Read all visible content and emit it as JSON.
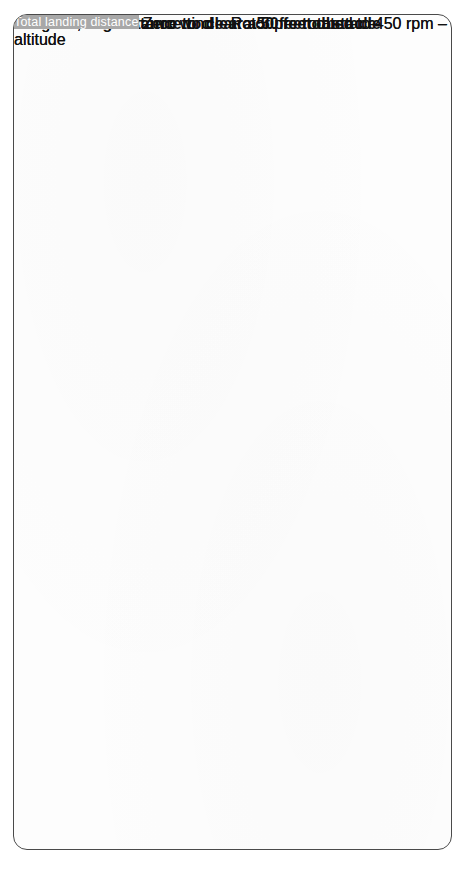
{
  "page": {
    "orientation": "rotated-90-ccw",
    "background": "#ffffff",
    "sheet_border_color": "#4a4a4a",
    "bar_color": "#a8a8a8",
    "label_chip_color": "#9c9c9c",
    "curve_color": "#1a1a1a"
  },
  "takeoff": {
    "title": "Total takeoff distance to clear a 50 feet obstacle",
    "subtitle": "Weight 1,500 lb – Zero wind – Rotor pre-rotated to 450 rpm – Smooth hard surface runway",
    "x_axis_label": "Total takeoff distance",
    "y_axis_label_line1": "Pressure",
    "y_axis_label_line2": "altitude",
    "x_ticks": [
      "800",
      "1,000",
      "1,200",
      "1,400",
      "1,600",
      "1,800",
      "2,000",
      "2,200",
      "2,400",
      "2,600",
      "2,800",
      "3,000"
    ],
    "y_ticks": [
      "0",
      "1,000",
      "2,000",
      "3,000",
      "4,000"
    ],
    "curve_labels": [
      "0 °F OAT",
      "20 °",
      "40 °",
      "60 °",
      "80 °",
      "100 °"
    ]
  },
  "landing": {
    "title": "Total landing distance to clear a 50 feet obstacle",
    "subtitle": "Weight 1,500 lb – Zero wind – Rotor pre-rotated to 450 rpm – Smooth hard surface runway",
    "x_axis_label": "Total landing distance",
    "y_axis_label_line1": "Pressure",
    "y_axis_label_line2": "altitude",
    "x_ticks": [
      "500",
      "510",
      "520",
      "530",
      "540"
    ],
    "y_ticks": [
      "0",
      "1,000",
      "2,000",
      "3,000",
      "4,000"
    ],
    "curve_labels": [
      "0 °F OAT",
      "20 °",
      "40 °",
      "60 °",
      "80 °",
      "100 °"
    ]
  },
  "chart_data": [
    {
      "type": "line",
      "id": "takeoff-distance",
      "title": "Total takeoff distance to clear a 50 feet obstacle",
      "subtitle": "Weight 1,500 lb – Zero wind – Rotor pre-rotated to 450 rpm – Smooth hard surface runway",
      "xlabel": "Total takeoff distance",
      "ylabel": "Pressure altitude",
      "xlim": [
        800,
        3000
      ],
      "ylim": [
        0,
        4000
      ],
      "xticks": [
        800,
        1000,
        1200,
        1400,
        1600,
        1800,
        2000,
        2200,
        2400,
        2600,
        2800,
        3000
      ],
      "yticks": [
        0,
        1000,
        2000,
        3000,
        4000
      ],
      "grid": true,
      "legend": "inline-curve-labels",
      "series": [
        {
          "name": "0 °F OAT",
          "x": [
            980,
            1540
          ],
          "y": [
            0,
            4000
          ]
        },
        {
          "name": "20 °",
          "x": [
            1130,
            1800
          ],
          "y": [
            0,
            4000
          ]
        },
        {
          "name": "40 °",
          "x": [
            1310,
            2090
          ],
          "y": [
            0,
            4000
          ]
        },
        {
          "name": "60 °",
          "x": [
            1500,
            2400
          ],
          "y": [
            0,
            4000
          ]
        },
        {
          "name": "80 °",
          "x": [
            1700,
            2700
          ],
          "y": [
            0,
            4000
          ]
        },
        {
          "name": "100 °",
          "x": [
            1930,
            3000
          ],
          "y": [
            0,
            4000
          ]
        }
      ]
    },
    {
      "type": "line",
      "id": "landing-distance",
      "title": "Total landing distance to clear a 50 feet obstacle",
      "subtitle": "Weight 1,500 lb – Zero wind – Rotor pre-rotated to 450 rpm – Smooth hard surface runway",
      "xlabel": "Total landing distance",
      "ylabel": "Pressure altitude",
      "xlim": [
        500,
        540
      ],
      "ylim": [
        0,
        4000
      ],
      "xticks": [
        500,
        510,
        520,
        530,
        540
      ],
      "yticks": [
        0,
        1000,
        2000,
        3000,
        4000
      ],
      "grid": true,
      "legend": "inline-curve-labels",
      "series": [
        {
          "name": "0 °F OAT",
          "x": [
            500.5,
            513.5
          ],
          "y": [
            0,
            4000
          ]
        },
        {
          "name": "20 °",
          "x": [
            504.0,
            518.0
          ],
          "y": [
            0,
            4000
          ]
        },
        {
          "name": "40 °",
          "x": [
            508.0,
            522.5
          ],
          "y": [
            0,
            4000
          ]
        },
        {
          "name": "60 °",
          "x": [
            512.0,
            527.0
          ],
          "y": [
            0,
            4000
          ]
        },
        {
          "name": "80 °",
          "x": [
            516.0,
            531.5
          ],
          "y": [
            0,
            4000
          ]
        },
        {
          "name": "100 °",
          "x": [
            520.0,
            536.0
          ],
          "y": [
            0,
            4000
          ]
        }
      ]
    }
  ]
}
